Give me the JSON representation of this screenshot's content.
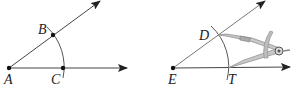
{
  "figures": [
    {
      "id": "left",
      "points": [
        {
          "label": "A",
          "x": 9,
          "y": 68,
          "lx": 4,
          "ly": 84
        },
        {
          "label": "B",
          "x": 53,
          "y": 35,
          "lx": 38,
          "ly": 34
        },
        {
          "label": "C",
          "x": 63,
          "y": 68,
          "lx": 52,
          "ly": 84
        }
      ]
    },
    {
      "id": "right",
      "points": [
        {
          "label": "E",
          "x": 173,
          "y": 68,
          "lx": 168,
          "ly": 84
        },
        {
          "label": "D",
          "x": 216,
          "y": 35,
          "lx": 199,
          "ly": 40
        },
        {
          "label": "T",
          "x": 227,
          "y": 68,
          "lx": 228,
          "ly": 84
        }
      ],
      "tool": "compass"
    }
  ],
  "colors": {
    "line": "#333333",
    "arc": "#555555",
    "compass": "#999999"
  }
}
